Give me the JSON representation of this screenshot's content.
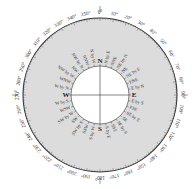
{
  "diagram": {
    "center": [
      100,
      95
    ],
    "outer_radius": 77,
    "inner_radius": 29,
    "ring_color": "#dcdcdc",
    "degree_labels": [
      "0°",
      "10°",
      "20°",
      "30°",
      "40°",
      "50°",
      "60°",
      "70°",
      "80°",
      "90°",
      "100°",
      "110°",
      "120°",
      "130°",
      "140°",
      "150°",
      "160°",
      "170°",
      "180°",
      "190°",
      "200°",
      "210°",
      "220°",
      "230°",
      "240°",
      "250°",
      "260°",
      "270°",
      "280°",
      "290°",
      "300°",
      "310°",
      "320°",
      "330°",
      "340°",
      "350°"
    ],
    "cardinals": [
      "N",
      "E",
      "S",
      "W"
    ],
    "points": [
      "N",
      "N by E",
      "NNE",
      "NE by N",
      "NE",
      "NE by E",
      "ENE",
      "E by N",
      "E",
      "E by S",
      "ESE",
      "SE by E",
      "SE",
      "SE by S",
      "SSE",
      "S by E",
      "S",
      "S by W",
      "SSW",
      "SW by S",
      "SW",
      "SW by W",
      "WSW",
      "W by S",
      "W",
      "W by N",
      "WNW",
      "NW by W",
      "NW",
      "NW by N",
      "NNW",
      "N by W"
    ]
  }
}
